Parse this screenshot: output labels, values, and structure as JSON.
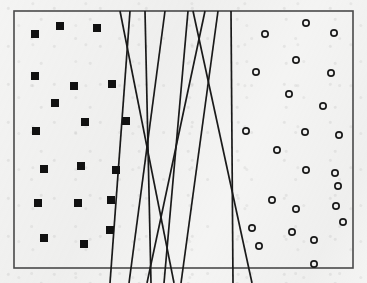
{
  "figure": {
    "background_color": "#f4f4f3",
    "ink_color": "#1a1a1a",
    "frame": {
      "x": 14,
      "y": 11,
      "width": 339,
      "height": 257,
      "stroke_width": 1.6,
      "stroke_color": "#4a4a4a"
    },
    "marker_styles": {
      "square": {
        "name": "filled-square",
        "fill": "#111111",
        "size": 8
      },
      "circle": {
        "name": "open-circle",
        "fill": "none",
        "stroke": "#1a1a1a",
        "diameter": 8,
        "stroke_width": 1.7
      }
    }
  },
  "chart_data": {
    "type": "scatter",
    "title": "",
    "subtitle": "",
    "xlabel": "",
    "ylabel": "",
    "xlim": [
      14,
      353
    ],
    "ylim": [
      11,
      268
    ],
    "grid": false,
    "legend_position": "none",
    "series": [
      {
        "name": "Class A (filled squares)",
        "marker": "filled-square",
        "color": "#111111",
        "count": 19,
        "points": [
          [
            35,
            34
          ],
          [
            60,
            26
          ],
          [
            97,
            28
          ],
          [
            35,
            76
          ],
          [
            74,
            86
          ],
          [
            112,
            84
          ],
          [
            55,
            103
          ],
          [
            85,
            122
          ],
          [
            126,
            121
          ],
          [
            36,
            131
          ],
          [
            44,
            169
          ],
          [
            81,
            166
          ],
          [
            116,
            170
          ],
          [
            38,
            203
          ],
          [
            78,
            203
          ],
          [
            111,
            200
          ],
          [
            44,
            238
          ],
          [
            110,
            230
          ],
          [
            84,
            244
          ]
        ]
      },
      {
        "name": "Class B (open circles)",
        "marker": "open-circle",
        "color": "#1a1a1a",
        "count": 24,
        "points": [
          [
            265,
            34
          ],
          [
            306,
            23
          ],
          [
            334,
            33
          ],
          [
            256,
            72
          ],
          [
            296,
            60
          ],
          [
            331,
            73
          ],
          [
            289,
            94
          ],
          [
            323,
            106
          ],
          [
            246,
            131
          ],
          [
            305,
            132
          ],
          [
            339,
            135
          ],
          [
            277,
            150
          ],
          [
            306,
            170
          ],
          [
            335,
            173
          ],
          [
            272,
            200
          ],
          [
            296,
            209
          ],
          [
            336,
            206
          ],
          [
            252,
            228
          ],
          [
            292,
            232
          ],
          [
            314,
            240
          ],
          [
            259,
            246
          ],
          [
            343,
            222
          ],
          [
            314,
            264
          ],
          [
            338,
            186
          ]
        ]
      }
    ],
    "annotations": [
      {
        "kind": "line-bundle",
        "label": "candidate separating hyperplanes",
        "count": 9
      }
    ],
    "lines": [
      {
        "id": "line-1",
        "x1": 120,
        "y1": 11,
        "x2": 174,
        "y2": 283
      },
      {
        "id": "line-2",
        "x1": 130,
        "y1": 11,
        "x2": 110,
        "y2": 283
      },
      {
        "id": "line-3",
        "x1": 145,
        "y1": 11,
        "x2": 151,
        "y2": 283
      },
      {
        "id": "line-4",
        "x1": 165,
        "y1": 11,
        "x2": 129,
        "y2": 283
      },
      {
        "id": "line-5",
        "x1": 188,
        "y1": 11,
        "x2": 164,
        "y2": 283
      },
      {
        "id": "line-6",
        "x1": 205,
        "y1": 11,
        "x2": 147,
        "y2": 283
      },
      {
        "id": "line-7",
        "x1": 218,
        "y1": 11,
        "x2": 181,
        "y2": 283
      },
      {
        "id": "line-8",
        "x1": 231,
        "y1": 11,
        "x2": 233,
        "y2": 283
      },
      {
        "id": "line-9",
        "x1": 193,
        "y1": 11,
        "x2": 252,
        "y2": 283
      }
    ]
  }
}
